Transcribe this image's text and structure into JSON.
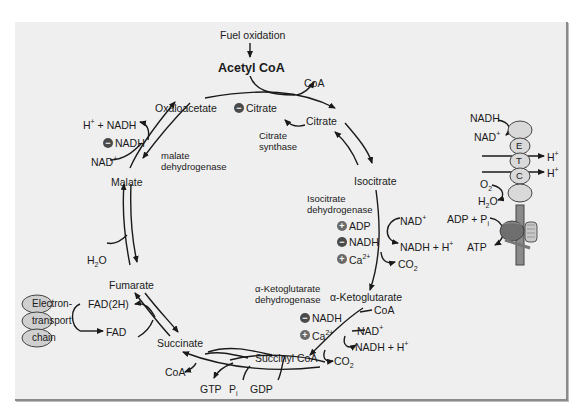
{
  "diagram": {
    "top": {
      "fuel_oxidation": "Fuel oxidation",
      "acetyl_coa": "Acetyl CoA",
      "coa_out": "CoA"
    },
    "intermediates": {
      "oxaloacetate": "Oxaloacetate",
      "citrate": "Citrate",
      "isocitrate": "Isocitrate",
      "alpha_ketoglutarate": "α-Ketoglutarate",
      "succinyl_coa": "Succinyl CoA",
      "succinate": "Succinate",
      "fumarate": "Fumarate",
      "malate": "Malate"
    },
    "enzymes": {
      "citrate_synthase": [
        "Citrate",
        "synthase"
      ],
      "isocitrate_dh": [
        "Isocitrate",
        "dehydrogenase"
      ],
      "akg_dh": [
        "α-Ketoglutarate",
        "dehydrogenase"
      ],
      "malate_dh": [
        "malate",
        "dehydrogenase"
      ]
    },
    "regulators": {
      "citrate_synthase": [
        {
          "sign": "-",
          "label": "Citrate"
        }
      ],
      "isocitrate_dh": [
        {
          "sign": "+",
          "label": "ADP"
        },
        {
          "sign": "-",
          "label": "NADH"
        },
        {
          "sign": "+",
          "label": "Ca2+"
        }
      ],
      "akg_dh": [
        {
          "sign": "-",
          "label": "NADH"
        },
        {
          "sign": "+",
          "label": "Ca2+"
        }
      ],
      "malate_dh": [
        {
          "sign": "-",
          "label": "NADH"
        }
      ]
    },
    "cofactors": {
      "isocitrate": {
        "in": "NAD+",
        "out": "NADH + H+",
        "co2": "CO2"
      },
      "akg": {
        "coa": "CoA",
        "in": "NAD+",
        "out": "NADH + H+",
        "co2": "CO2"
      },
      "succinyl": {
        "coa": "CoA",
        "gtp": "GTP",
        "pi": "Pi",
        "gdp": "GDP"
      },
      "succinate": {
        "fad2h": "FAD(2H)",
        "fad": "FAD"
      },
      "fumarate": {
        "h2o": "H2O"
      },
      "malate": {
        "in": "NAD+",
        "out": "H+ + NADH"
      }
    },
    "etc_box": {
      "line1": "Electron-",
      "line2": "transport",
      "line3": "chain"
    },
    "etc_right": {
      "nadh": "NADH",
      "nad": "NAD+",
      "letters": [
        "E",
        "T",
        "C"
      ],
      "h_plus": "H+",
      "o2": "O2",
      "h2o": "H2O",
      "adp_pi": "ADP + Pi",
      "atp": "ATP"
    },
    "colors": {
      "panel_bg": "#efefef",
      "arrow": "#1a1a1a",
      "inhibit_badge": "#4a4a4a",
      "activate_badge": "#6a6a6a",
      "etc_complex": "#d9d9d9",
      "atp_synthase": "#6e6e6e"
    }
  }
}
